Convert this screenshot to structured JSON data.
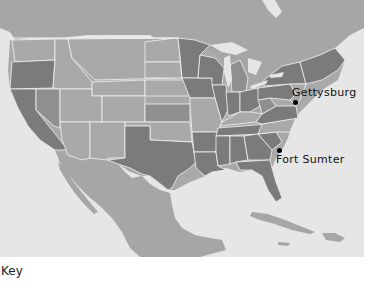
{
  "map": {
    "title": "",
    "colors": {
      "water": "#e6e6e6",
      "foreign_land": "#a6a6a6",
      "state_light": "#a9a9a9",
      "state_mid": "#8f8f8f",
      "state_dark": "#7b7b7b",
      "border": "#f2f2f2",
      "marker": "#000000"
    },
    "markers": [
      {
        "name": "Gettysburg",
        "label": "Gettysburg",
        "x": 295,
        "y": 102
      },
      {
        "name": "Fort Sumter",
        "label": "Fort Sumter",
        "x": 279,
        "y": 150
      }
    ]
  },
  "key": {
    "label": "Key"
  }
}
